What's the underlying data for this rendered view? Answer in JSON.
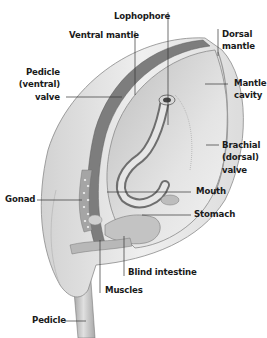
{
  "diagram": {
    "labels": [
      {
        "id": "lophophore",
        "lines": [
          "Lophophore"
        ]
      },
      {
        "id": "ventral-mantle",
        "lines": [
          "Ventral mantle"
        ]
      },
      {
        "id": "dorsal-mantle",
        "lines": [
          "Dorsal",
          "mantle"
        ]
      },
      {
        "id": "pedicle-valve",
        "lines": [
          "Pedicle",
          "(ventral)",
          "valve"
        ]
      },
      {
        "id": "mantle-cavity",
        "lines": [
          "Mantle",
          "cavity"
        ]
      },
      {
        "id": "brachial-valve",
        "lines": [
          "Brachial",
          "(dorsal)",
          "valve"
        ]
      },
      {
        "id": "mouth",
        "lines": [
          "Mouth"
        ]
      },
      {
        "id": "gonad",
        "lines": [
          "Gonad"
        ]
      },
      {
        "id": "stomach",
        "lines": [
          "Stomach"
        ]
      },
      {
        "id": "blind-intestine",
        "lines": [
          "Blind intestine"
        ]
      },
      {
        "id": "muscles",
        "lines": [
          "Muscles"
        ]
      },
      {
        "id": "pedicle",
        "lines": [
          "Pedicle"
        ]
      }
    ],
    "colors": {
      "background": "#ffffff",
      "shell_light": "#ececec",
      "shell_mid": "#c9c9c9",
      "shell_dark": "#8a8a8a",
      "leader_line": "#333333",
      "text": "#1a1a1a"
    }
  }
}
